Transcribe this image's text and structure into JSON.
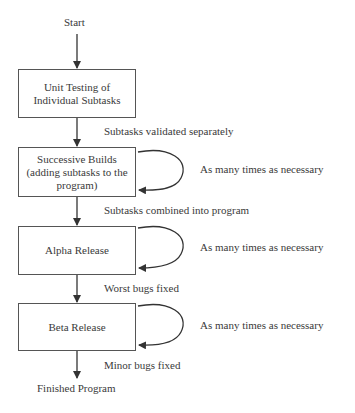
{
  "diagram": {
    "start": "Start",
    "end": "Finished Program",
    "steps": [
      {
        "label_lines": [
          "Unit Testing of",
          "Individual Subtasks"
        ],
        "loop": false
      },
      {
        "label_lines": [
          "Successive Builds",
          "(adding subtasks to the",
          "program)"
        ],
        "loop": true,
        "loop_label": "As many times as necessary"
      },
      {
        "label_lines": [
          "Alpha Release"
        ],
        "loop": true,
        "loop_label": "As many times as necessary"
      },
      {
        "label_lines": [
          "Beta Release"
        ],
        "loop": true,
        "loop_label": "As many times as necessary"
      }
    ],
    "transitions": [
      "Subtasks validated separately",
      "Subtasks combined into program",
      "Worst bugs fixed",
      "Minor bugs fixed"
    ]
  }
}
